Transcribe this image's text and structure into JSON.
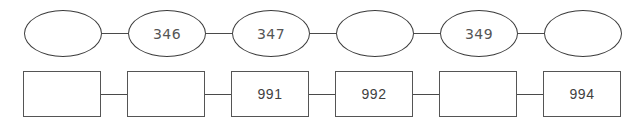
{
  "diagram": {
    "title": "",
    "background_color": "#ffffff",
    "rows": [
      {
        "name": "ellipse-chain",
        "shape": "ellipse",
        "stroke_color": "#3c3c3c",
        "text_color": "#555555",
        "nodes": [
          {
            "label": ""
          },
          {
            "label": "346"
          },
          {
            "label": "347"
          },
          {
            "label": ""
          },
          {
            "label": "349"
          },
          {
            "label": ""
          }
        ]
      },
      {
        "name": "rect-chain",
        "shape": "rectangle",
        "stroke_color": "#555555",
        "text_color": "#3f3f3f",
        "nodes": [
          {
            "label": ""
          },
          {
            "label": ""
          },
          {
            "label": "991"
          },
          {
            "label": "992"
          },
          {
            "label": ""
          },
          {
            "label": "994"
          }
        ]
      }
    ]
  }
}
